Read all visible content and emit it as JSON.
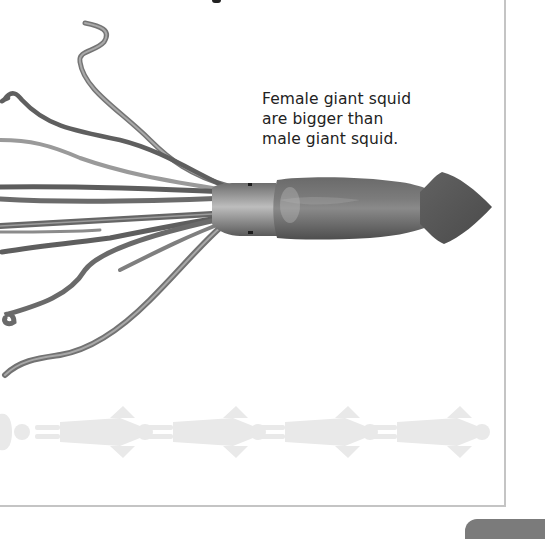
{
  "page": {
    "caption_lines": [
      "Female giant squid",
      "are bigger than",
      "male giant squid."
    ],
    "illustration": {
      "subject": "giant-squid",
      "scale_figures": {
        "subject": "human-silhouette",
        "count": 5,
        "orientation": "horizontal"
      }
    },
    "colors": {
      "squid_body": "#5e5e5e",
      "squid_light": "#b5b5b5",
      "tentacle": "#6a6a6a",
      "silhouette": "#e9e9e9",
      "frame": "#c4c4c4",
      "page_tab": "#7b7b7b",
      "text": "#222222"
    }
  }
}
